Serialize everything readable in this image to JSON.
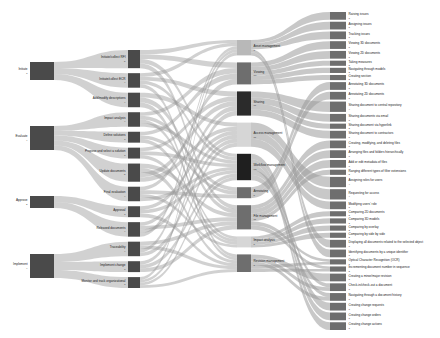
{
  "chart_data": {
    "type": "sankey",
    "title": "",
    "colors": {
      "node_dark": "#4a4a4a",
      "node_darker": "#2b2b2b",
      "node_mid": "#6e6e6e",
      "node_light": "#b8b8b8",
      "node_lighter": "#d6d6d6",
      "link": "#9a9a9a",
      "background": "#ffffff",
      "label_text": "#1a1a1a",
      "value_text": "#444444"
    },
    "columns": [
      {
        "index": 0,
        "name": "phase",
        "nodes": [
          {
            "id": "initiate",
            "label": "Initiate",
            "value": 3
          },
          {
            "id": "evaluate",
            "label": "Evaluate",
            "value": 4
          },
          {
            "id": "approve",
            "label": "Approve",
            "value": 2
          },
          {
            "id": "implement",
            "label": "Implement",
            "value": 4
          }
        ]
      },
      {
        "index": 1,
        "name": "activity",
        "nodes": [
          {
            "id": "initiate_collect_rfi",
            "label": "Initiate/collect RFI",
            "value": 5
          },
          {
            "id": "initiate_collect_ecr",
            "label": "Initiate/collect ECR",
            "value": 4
          },
          {
            "id": "add_modify_desc",
            "label": "Add/modify descriptions",
            "value": 4
          },
          {
            "id": "impact_analysis_act",
            "label": "Impact analysis",
            "value": 4
          },
          {
            "id": "define_solutions",
            "label": "Define solutions",
            "value": 3
          },
          {
            "id": "propose_select",
            "label": "Propose and select a solution",
            "value": 3
          },
          {
            "id": "update_documents",
            "label": "Update documents",
            "value": 5
          },
          {
            "id": "final_evaluation",
            "label": "Final evaluation",
            "value": 4
          },
          {
            "id": "approval",
            "label": "Approval",
            "value": 3
          },
          {
            "id": "released_documents",
            "label": "Released documents",
            "value": 4
          },
          {
            "id": "traceability",
            "label": "Traceability",
            "value": 4
          },
          {
            "id": "implement_change",
            "label": "Implement change",
            "value": 3
          },
          {
            "id": "monitor_track",
            "label": "Monitor and track organizational",
            "value": 3
          }
        ]
      },
      {
        "index": 2,
        "name": "capability",
        "nodes": [
          {
            "id": "asset_management",
            "label": "Asset management",
            "value": 7
          },
          {
            "id": "viewing",
            "label": "Viewing",
            "value": 10
          },
          {
            "id": "sharing",
            "label": "Sharing",
            "value": 11
          },
          {
            "id": "access_management",
            "label": "Access management",
            "value": 11
          },
          {
            "id": "workflow_management",
            "label": "Workflow management",
            "value": 12
          },
          {
            "id": "annotating",
            "label": "Annotating",
            "value": 5
          },
          {
            "id": "file_management",
            "label": "File management",
            "value": 11
          },
          {
            "id": "impact_analysis_cap",
            "label": "Impact analysis",
            "value": 5
          },
          {
            "id": "revision_management",
            "label": "Revision management",
            "value": 8
          }
        ]
      },
      {
        "index": 3,
        "name": "function",
        "nodes": [
          {
            "id": "raising_issues",
            "label": "Raising issues",
            "value": 3
          },
          {
            "id": "assigning_issues",
            "label": "Assigning issues",
            "value": 3
          },
          {
            "id": "tracking_issues",
            "label": "Tracking issues",
            "value": 3
          },
          {
            "id": "viewing_3d",
            "label": "Viewing 3D documents",
            "value": 3
          },
          {
            "id": "viewing_2d",
            "label": "Viewing 2D documents",
            "value": 3
          },
          {
            "id": "taking_measures",
            "label": "Taking measures",
            "value": 2
          },
          {
            "id": "navigating_models",
            "label": "Navigating through models",
            "value": 2
          },
          {
            "id": "creating_section",
            "label": "Creating section",
            "value": 2
          },
          {
            "id": "annotating_3d",
            "label": "Annotating 3D documents",
            "value": 3
          },
          {
            "id": "annotating_2d",
            "label": "Annotating 2D documents",
            "value": 3
          },
          {
            "id": "sharing_central_repo",
            "label": "Sharing document to central repository",
            "value": 4
          },
          {
            "id": "sharing_email",
            "label": "Sharing documents via email",
            "value": 3
          },
          {
            "id": "sharing_hyperlink",
            "label": "Sharing document via hyperlink",
            "value": 2
          },
          {
            "id": "sharing_contractors",
            "label": "Sharing document to contractors",
            "value": 3
          },
          {
            "id": "crud_files",
            "label": "Creating, modifying, and deleting files",
            "value": 3
          },
          {
            "id": "arranging_files",
            "label": "Arranging files and folders hierarchically",
            "value": 3
          },
          {
            "id": "edit_metadata",
            "label": "Add or edit metadata of files",
            "value": 3
          },
          {
            "id": "ranging_filetypes",
            "label": "Ranging different types of filter extensions",
            "value": 2
          },
          {
            "id": "assigning_roles",
            "label": "Assigning roles for users",
            "value": 4
          },
          {
            "id": "requesting_access",
            "label": "Requesting for access",
            "value": 4
          },
          {
            "id": "modifying_role",
            "label": "Modifying users' role",
            "value": 3
          },
          {
            "id": "comparing_2d",
            "label": "Comparing 2D documents",
            "value": 2
          },
          {
            "id": "comparing_3d",
            "label": "Comparing 3D models",
            "value": 2
          },
          {
            "id": "comparing_overlay",
            "label": "Comparing by overlay",
            "value": 2
          },
          {
            "id": "comparing_side",
            "label": "Comparing by side by side",
            "value": 2
          },
          {
            "id": "displaying_related",
            "label": "Displaying all documents related to the selected object",
            "value": 3
          },
          {
            "id": "identifying_unique_id",
            "label": "Identifying documents by a unique identifier",
            "value": 3
          },
          {
            "id": "ocr",
            "label": "Optical Character Recognition (OCR)",
            "value": 2
          },
          {
            "id": "incrementing_number",
            "label": "Incrementing document number in sequence",
            "value": 2
          },
          {
            "id": "creating_revision",
            "label": "Creating a minor/major revision",
            "value": 3
          },
          {
            "id": "check_in_out",
            "label": "Check-in/check-out a document",
            "value": 3
          },
          {
            "id": "navigating_history",
            "label": "Navigating through a document history",
            "value": 3
          },
          {
            "id": "creating_change_req",
            "label": "Creating change requests",
            "value": 3
          },
          {
            "id": "creating_change_ord",
            "label": "Creating change orders",
            "value": 3
          },
          {
            "id": "creating_change_act",
            "label": "Creating change actions",
            "value": 3
          }
        ]
      }
    ]
  }
}
